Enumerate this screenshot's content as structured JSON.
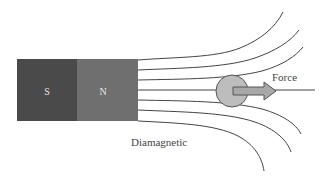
{
  "diagram": {
    "magnet": {
      "south_label": "S",
      "north_label": "N",
      "south_color": "#4a4a4a",
      "north_color": "#6f6f6f",
      "label_color": "#e6e6e6"
    },
    "sample": {
      "label": "Diamagnetic",
      "fill": "#bdbdbd",
      "stroke": "#555555"
    },
    "force": {
      "label": "Force",
      "arrow_fill": "#a8a8a8",
      "arrow_stroke": "#555555"
    },
    "field_line_color": "#444444",
    "text_color": "#444444"
  }
}
